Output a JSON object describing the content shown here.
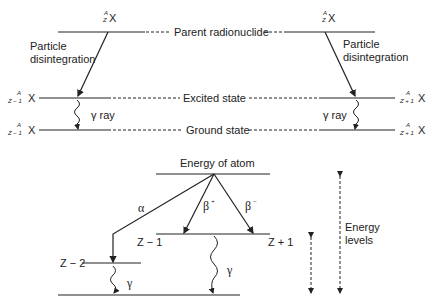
{
  "top_diagram": {
    "parent_label": "Parent radionuclide",
    "excited_label": "Excited state",
    "ground_label": "Ground state",
    "left": {
      "parent_nuclide": {
        "mass": "A",
        "atomic": "Z",
        "symbol": "X"
      },
      "excited_nuclide": {
        "mass": "A",
        "atomic": "Z − 1",
        "symbol": "X"
      },
      "ground_nuclide": {
        "mass": "A",
        "atomic": "Z − 1",
        "symbol": "X"
      },
      "transition_label_line1": "Particle",
      "transition_label_line2": "disintegration",
      "gamma_label": "γ ray"
    },
    "right": {
      "parent_nuclide": {
        "mass": "A",
        "atomic": "Z",
        "symbol": "X"
      },
      "excited_nuclide": {
        "mass": "A",
        "atomic": "Z + 1",
        "symbol": "X"
      },
      "ground_nuclide": {
        "mass": "A",
        "atomic": "Z + 1",
        "symbol": "X"
      },
      "transition_label_line1": "Particle",
      "transition_label_line2": "disintegration",
      "gamma_label": "γ ray"
    }
  },
  "bottom_diagram": {
    "top_label": "Energy of atom",
    "alpha_label": "α",
    "beta_plus_label": "β",
    "beta_plus_sup": "+",
    "beta_minus_label": "β",
    "beta_minus_sup": "−",
    "level_z_minus_1": "Z − 1",
    "level_z_plus_1": "Z + 1",
    "level_z_minus_2": "Z − 2",
    "gamma_left": "γ",
    "gamma_right": "γ",
    "energy_levels_line1": "Energy",
    "energy_levels_line2": "levels"
  }
}
